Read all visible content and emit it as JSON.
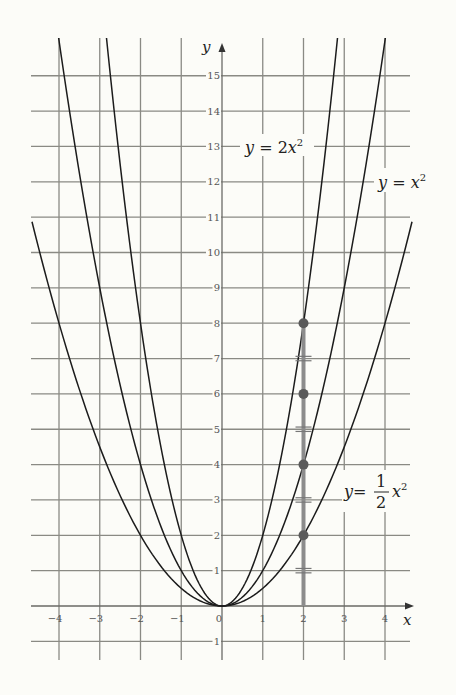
{
  "chart_data": {
    "type": "line",
    "title": "",
    "xlabel": "x",
    "ylabel": "y",
    "xlim": [
      -4.7,
      4.7
    ],
    "ylim": [
      -1.5,
      16
    ],
    "grid": true,
    "x_ticks": [
      -4,
      -3,
      -2,
      -1,
      0,
      1,
      2,
      3,
      4
    ],
    "y_ticks": [
      -1,
      1,
      2,
      3,
      4,
      5,
      6,
      7,
      8,
      9,
      10,
      11,
      12,
      13,
      14,
      15
    ],
    "series": [
      {
        "name": "y = 2x²",
        "label_main": "y = 2x",
        "label_sup": "2",
        "a": 2
      },
      {
        "name": "y = x²",
        "label_main": "y = x",
        "label_sup": "2",
        "a": 1
      },
      {
        "name": "y = ½x²",
        "label_num": "1",
        "label_den": "2",
        "a": 0.5
      }
    ],
    "highlight": {
      "x": 2,
      "segment_y": [
        0,
        8
      ],
      "points": [
        {
          "x": 2,
          "y": 8
        },
        {
          "x": 2,
          "y": 6
        },
        {
          "x": 2,
          "y": 4
        },
        {
          "x": 2,
          "y": 2
        }
      ],
      "equal_marks_y": [
        7,
        5,
        3,
        1
      ]
    }
  },
  "labels": {
    "y_axis": "y",
    "x_axis": "x",
    "origin": "0",
    "eq_2x2_lhs": "y",
    "eq_2x2_rhs": " = 2",
    "eq_2x2_var": "x",
    "eq_2x2_sup": "2",
    "eq_x2_lhs": "y",
    "eq_x2_rhs": " = ",
    "eq_x2_var": "x",
    "eq_x2_sup": "2",
    "eq_half_lhs": "y",
    "eq_half_rhs": "=",
    "eq_half_num": "1",
    "eq_half_den": "2",
    "eq_half_var": "x",
    "eq_half_sup": "2"
  }
}
